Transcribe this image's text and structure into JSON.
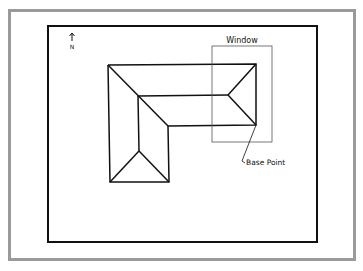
{
  "drawing": {
    "north_label": "N",
    "window_label": "Window",
    "base_point_label": "Base Point"
  },
  "colors": {
    "frame": "#9a9a9a",
    "border": "#111111",
    "roof_lines": "#111111",
    "window_rect": "#666666"
  }
}
